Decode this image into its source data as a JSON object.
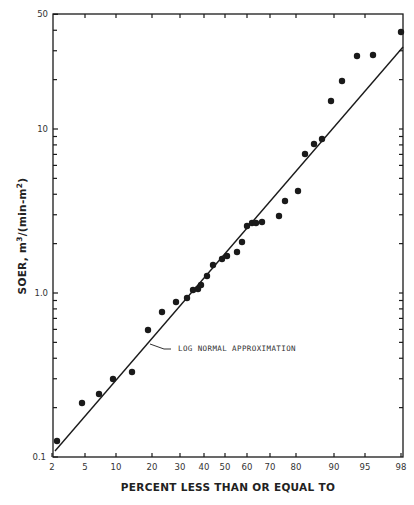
{
  "chart_data": {
    "type": "scatter",
    "title": "",
    "xlabel": "PERCENT LESS THAN OR EQUAL TO",
    "ylabel": "SOER, m3/(min-m2)",
    "ylabel_parts": {
      "main": "SOER, m",
      "sup1": "3",
      "mid": "/(min-m",
      "sup2": "2",
      "end": ")"
    },
    "x_scale": "probability",
    "y_scale": "log",
    "xlim": [
      2,
      98
    ],
    "ylim": [
      0.1,
      50
    ],
    "x_ticks": [
      2,
      5,
      10,
      20,
      30,
      40,
      50,
      60,
      70,
      80,
      90,
      95,
      98
    ],
    "x_tick_labels": [
      "2",
      "5",
      "10",
      "20",
      "30",
      "40",
      "50",
      "60",
      "70",
      "80",
      "90",
      "95",
      "98"
    ],
    "y_tick_labels": [
      "0.1",
      "1.0",
      "10",
      "50"
    ],
    "y_labeled_ticks": [
      0.1,
      1.0,
      10,
      50
    ],
    "grid": false,
    "legend": null,
    "annotations": [
      {
        "text": "LOG NORMAL APPROXIMATION",
        "points_to": "fitted line"
      }
    ],
    "series": [
      {
        "name": "Observed SOER",
        "type": "scatter",
        "x": [
          2.5,
          4.6,
          7,
          9.5,
          14,
          19,
          23.5,
          28.5,
          33,
          35.5,
          37.5,
          39,
          41.5,
          44.5,
          48.5,
          51,
          55.5,
          57.5,
          60,
          62,
          64,
          66.5,
          73.5,
          75.5,
          81,
          83,
          85.5,
          87.5,
          89.5,
          91.5,
          94,
          95.5,
          98
        ],
        "y": [
          0.125,
          0.21,
          0.24,
          0.3,
          0.33,
          0.59,
          0.77,
          0.88,
          0.93,
          1.04,
          1.06,
          1.12,
          1.27,
          1.48,
          1.61,
          1.68,
          1.78,
          2.05,
          2.56,
          2.67,
          2.67,
          2.71,
          2.95,
          3.64,
          4.19,
          7.05,
          8.1,
          8.7,
          14.8,
          19.7,
          27.8,
          28.2,
          39.0
        ]
      },
      {
        "name": "LOG NORMAL APPROXIMATION",
        "type": "line",
        "x": [
          2.2,
          98
        ],
        "y": [
          0.109,
          31.6
        ]
      }
    ]
  },
  "plot": {
    "frame": {
      "left": 53,
      "right": 403,
      "top": 14,
      "bottom": 457
    },
    "x_tick_px": [
      52,
      85,
      116,
      152,
      180,
      204,
      225,
      247,
      270,
      296,
      334,
      365,
      401
    ],
    "y_decade_px": 164,
    "y_one_px": 293,
    "points_px": [
      [
        57,
        441
      ],
      [
        82,
        403
      ],
      [
        99,
        394
      ],
      [
        113,
        379
      ],
      [
        132,
        372
      ],
      [
        148,
        330
      ],
      [
        162,
        312
      ],
      [
        176,
        302
      ],
      [
        187,
        298
      ],
      [
        193,
        290
      ],
      [
        198,
        289
      ],
      [
        201,
        285
      ],
      [
        207,
        276
      ],
      [
        213,
        265
      ],
      [
        222,
        259
      ],
      [
        227,
        256
      ],
      [
        237,
        252
      ],
      [
        242,
        242
      ],
      [
        247,
        226
      ],
      [
        252,
        223
      ],
      [
        256,
        223
      ],
      [
        262,
        222
      ],
      [
        279,
        216
      ],
      [
        285,
        201
      ],
      [
        298,
        191
      ],
      [
        305,
        154
      ],
      [
        314,
        144
      ],
      [
        322,
        139
      ],
      [
        331,
        101
      ],
      [
        342,
        81
      ],
      [
        357,
        56
      ],
      [
        373,
        55
      ],
      [
        401,
        32
      ]
    ],
    "line_px": [
      [
        55,
        451
      ],
      [
        403,
        47
      ]
    ],
    "colors": {
      "ink": "#1a1a1a",
      "background": "#ffffff"
    }
  },
  "labels": {
    "annotation": "LOG NORMAL APPROXIMATION",
    "xlabel": "PERCENT LESS THAN OR EQUAL TO",
    "ytick_01": "0.1",
    "ytick_1": "1.0",
    "ytick_10": "10",
    "ytick_50": "50"
  }
}
